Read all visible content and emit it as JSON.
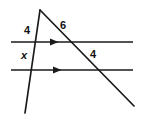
{
  "figure": {
    "kind": "geometry-diagram",
    "stroke_color": "#1a1a1a",
    "label_color": "#111111",
    "background_color": "#ffffff",
    "width": 142,
    "height": 126,
    "labels": {
      "top_left_segment": "4",
      "top_right_segment": "6",
      "lower_left_segment": "x",
      "lower_right_segment": "4"
    },
    "geometry": {
      "apex": {
        "x": 40,
        "y": 10
      },
      "left_transversal": {
        "x1": 40,
        "y1": 10,
        "x2": 25,
        "y2": 113
      },
      "right_transversal": {
        "x1": 40,
        "y1": 10,
        "x2": 134,
        "y2": 106
      },
      "upper_parallel_line": {
        "x1": 11,
        "y1": 42,
        "x2": 133,
        "y2": 42
      },
      "lower_parallel_line": {
        "x1": 11,
        "y1": 70,
        "x2": 133,
        "y2": 70
      },
      "upper_arrow_marker_x": 55,
      "lower_arrow_marker_x": 58,
      "intersections": {
        "upper_left": {
          "x": 35,
          "y": 42
        },
        "upper_right": {
          "x": 71,
          "y": 42
        },
        "lower_left": {
          "x": 31,
          "y": 70
        },
        "lower_right": {
          "x": 98,
          "y": 70
        }
      }
    }
  }
}
